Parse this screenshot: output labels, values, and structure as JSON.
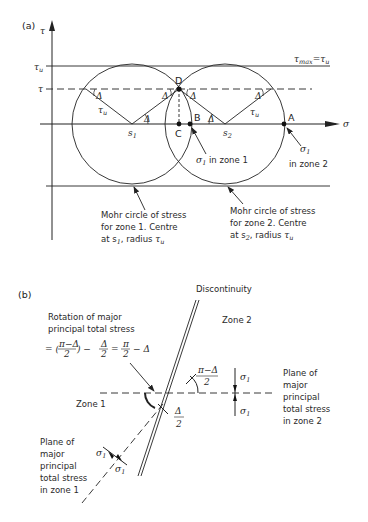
{
  "panel_a": {
    "label": "(a)",
    "axes": {
      "y_label": "τ",
      "x_label": "σ"
    },
    "levels": {
      "tau_u": "τu",
      "tau": "τ",
      "tau_max_eq": "τmax = τu"
    },
    "points": {
      "D": "D",
      "C": "C",
      "B": "B",
      "A": "A",
      "s1": "s1",
      "s2": "s2"
    },
    "radius_label": "τu",
    "angle_label": "Δ",
    "annotations": {
      "sigma1_zone1": "σ1 in zone 1",
      "sigma1_zone2_a": "σ1",
      "sigma1_zone2_b": "in zone 2",
      "circle1": [
        "Mohr circle of stress",
        "for zone 1. Centre",
        "at s1, radius τu"
      ],
      "circle2": [
        "Mohr circle of stress",
        "for zone 2. Centre",
        "at s2, radius τu"
      ]
    }
  },
  "panel_b": {
    "label": "(b)",
    "discontinuity": "Discontinuity",
    "zone2": "Zone 2",
    "zone1": "Zone 1",
    "rotation": [
      "Rotation of major",
      "principal total stress"
    ],
    "rotation_formula": "= ((π−Δ)/2) − Δ/2 = π/2 − Δ",
    "angle_top": {
      "num": "π−Δ",
      "den": "2"
    },
    "angle_bottom": {
      "num": "Δ",
      "den": "2"
    },
    "sigma": "σ1",
    "plane_zone2": [
      "Plane of",
      "major",
      "principal",
      "total stress",
      "in zone 2"
    ],
    "plane_zone1": [
      "Plane of",
      "major",
      "principal",
      "total stress",
      "in zone 1"
    ]
  }
}
